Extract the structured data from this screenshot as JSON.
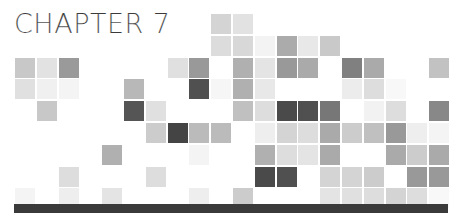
{
  "title": "CHAPTER 7",
  "grid": {
    "origin_x": 15,
    "origin_y": 14,
    "pitch_x": 21.8,
    "pitch_y": 21.8,
    "cell_size": 20,
    "cells": [
      {
        "r": 0,
        "c": 9,
        "color": "#d4d4d4"
      },
      {
        "r": 0,
        "c": 10,
        "color": "#e2e2e2"
      },
      {
        "r": 1,
        "c": 9,
        "color": "#dcdcdc"
      },
      {
        "r": 1,
        "c": 10,
        "color": "#d8d8d8"
      },
      {
        "r": 1,
        "c": 11,
        "color": "#f3f3f3"
      },
      {
        "r": 1,
        "c": 12,
        "color": "#ababab"
      },
      {
        "r": 1,
        "c": 13,
        "color": "#e8e8e8"
      },
      {
        "r": 1,
        "c": 14,
        "color": "#c9c9c9"
      },
      {
        "r": 2,
        "c": 0,
        "color": "#c8c8c8"
      },
      {
        "r": 2,
        "c": 1,
        "color": "#e2e2e2"
      },
      {
        "r": 2,
        "c": 2,
        "color": "#9a9a9a"
      },
      {
        "r": 2,
        "c": 7,
        "color": "#e0e0e0"
      },
      {
        "r": 2,
        "c": 8,
        "color": "#999999"
      },
      {
        "r": 2,
        "c": 10,
        "color": "#b0b0b0"
      },
      {
        "r": 2,
        "c": 11,
        "color": "#e4e4e4"
      },
      {
        "r": 2,
        "c": 12,
        "color": "#999999"
      },
      {
        "r": 2,
        "c": 13,
        "color": "#aaaaaa"
      },
      {
        "r": 2,
        "c": 15,
        "color": "#808080"
      },
      {
        "r": 2,
        "c": 16,
        "color": "#aaaaaa"
      },
      {
        "r": 2,
        "c": 19,
        "color": "#c2c2c2"
      },
      {
        "r": 3,
        "c": 0,
        "color": "#e0e0e0"
      },
      {
        "r": 3,
        "c": 1,
        "color": "#f0f0f0"
      },
      {
        "r": 3,
        "c": 2,
        "color": "#f4f4f4"
      },
      {
        "r": 3,
        "c": 5,
        "color": "#b8b8b8"
      },
      {
        "r": 3,
        "c": 8,
        "color": "#505050"
      },
      {
        "r": 3,
        "c": 9,
        "color": "#f6f6f6"
      },
      {
        "r": 3,
        "c": 10,
        "color": "#b0b0b0"
      },
      {
        "r": 3,
        "c": 11,
        "color": "#e8e8e8"
      },
      {
        "r": 3,
        "c": 15,
        "color": "#ececec"
      },
      {
        "r": 3,
        "c": 16,
        "color": "#dddddd"
      },
      {
        "r": 3,
        "c": 17,
        "color": "#f8f8f8"
      },
      {
        "r": 4,
        "c": 1,
        "color": "#c8c8c8"
      },
      {
        "r": 4,
        "c": 5,
        "color": "#555555"
      },
      {
        "r": 4,
        "c": 6,
        "color": "#e0e0e0"
      },
      {
        "r": 4,
        "c": 10,
        "color": "#c0c0c0"
      },
      {
        "r": 4,
        "c": 11,
        "color": "#dddddd"
      },
      {
        "r": 4,
        "c": 12,
        "color": "#4a4a4a"
      },
      {
        "r": 4,
        "c": 13,
        "color": "#505050"
      },
      {
        "r": 4,
        "c": 14,
        "color": "#777777"
      },
      {
        "r": 4,
        "c": 16,
        "color": "#f2f2f2"
      },
      {
        "r": 4,
        "c": 17,
        "color": "#dddddd"
      },
      {
        "r": 4,
        "c": 19,
        "color": "#888888"
      },
      {
        "r": 5,
        "c": 6,
        "color": "#cccccc"
      },
      {
        "r": 5,
        "c": 7,
        "color": "#444444"
      },
      {
        "r": 5,
        "c": 8,
        "color": "#bbbbbb"
      },
      {
        "r": 5,
        "c": 9,
        "color": "#bbbbbb"
      },
      {
        "r": 5,
        "c": 11,
        "color": "#eeeeee"
      },
      {
        "r": 5,
        "c": 12,
        "color": "#d4d4d4"
      },
      {
        "r": 5,
        "c": 13,
        "color": "#dddddd"
      },
      {
        "r": 5,
        "c": 14,
        "color": "#aaaaaa"
      },
      {
        "r": 5,
        "c": 15,
        "color": "#cccccc"
      },
      {
        "r": 5,
        "c": 16,
        "color": "#c0c0c0"
      },
      {
        "r": 5,
        "c": 17,
        "color": "#999999"
      },
      {
        "r": 5,
        "c": 18,
        "color": "#eeeeee"
      },
      {
        "r": 5,
        "c": 19,
        "color": "#f4f4f4"
      },
      {
        "r": 6,
        "c": 4,
        "color": "#b0b0b0"
      },
      {
        "r": 6,
        "c": 8,
        "color": "#f4f4f4"
      },
      {
        "r": 6,
        "c": 11,
        "color": "#b0b0b0"
      },
      {
        "r": 6,
        "c": 12,
        "color": "#dddddd"
      },
      {
        "r": 6,
        "c": 13,
        "color": "#e4e4e4"
      },
      {
        "r": 6,
        "c": 14,
        "color": "#aaaaaa"
      },
      {
        "r": 6,
        "c": 17,
        "color": "#aaaaaa"
      },
      {
        "r": 6,
        "c": 18,
        "color": "#cccccc"
      },
      {
        "r": 6,
        "c": 19,
        "color": "#aaaaaa"
      },
      {
        "r": 7,
        "c": 2,
        "color": "#dddddd"
      },
      {
        "r": 7,
        "c": 6,
        "color": "#dddddd"
      },
      {
        "r": 7,
        "c": 11,
        "color": "#4a4a4a"
      },
      {
        "r": 7,
        "c": 12,
        "color": "#505050"
      },
      {
        "r": 7,
        "c": 14,
        "color": "#d4d4d4"
      },
      {
        "r": 7,
        "c": 15,
        "color": "#d4d4d4"
      },
      {
        "r": 7,
        "c": 16,
        "color": "#cccccc"
      },
      {
        "r": 7,
        "c": 18,
        "color": "#999999"
      },
      {
        "r": 7,
        "c": 19,
        "color": "#999999"
      },
      {
        "r": 8,
        "c": 0,
        "color": "#f4f4f4"
      },
      {
        "r": 8,
        "c": 2,
        "color": "#eeeeee"
      },
      {
        "r": 8,
        "c": 4,
        "color": "#e4e4e4"
      },
      {
        "r": 8,
        "c": 8,
        "color": "#eeeeee"
      },
      {
        "r": 8,
        "c": 10,
        "color": "#cccccc"
      },
      {
        "r": 8,
        "c": 14,
        "color": "#e4e4e4"
      },
      {
        "r": 8,
        "c": 15,
        "color": "#e0e0e0"
      },
      {
        "r": 8,
        "c": 16,
        "color": "#dddddd"
      },
      {
        "r": 8,
        "c": 17,
        "color": "#d4d4d4"
      },
      {
        "r": 8,
        "c": 18,
        "color": "#dddddd"
      },
      {
        "r": 8,
        "c": 19,
        "color": "#f8f8f8"
      }
    ]
  },
  "bar": {
    "color": "#3a3a3a"
  }
}
